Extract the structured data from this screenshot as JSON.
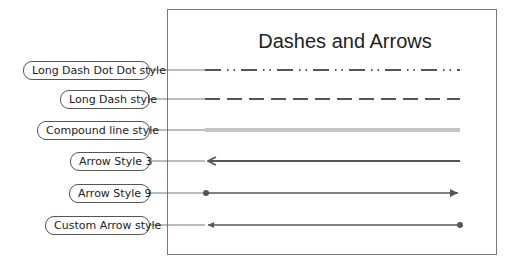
{
  "diagram": {
    "title": "Dashes and Arrows",
    "colors": {
      "line": "#555555",
      "frame": "#7a7a7a",
      "compound": "#8a8a8a",
      "label_border": "#555555"
    },
    "rows": [
      {
        "label": "Long Dash Dot Dot style",
        "style": "long-dash-dot-dot",
        "y": 70
      },
      {
        "label": "Long Dash style",
        "style": "long-dash",
        "y": 99
      },
      {
        "label": "Compound line style",
        "style": "compound",
        "y": 130
      },
      {
        "label": "Arrow Style 3",
        "style": "arrow-start-open",
        "y": 161
      },
      {
        "label": "Arrow Style 9",
        "style": "dot-start-arrow-end",
        "y": 193
      },
      {
        "label": "Custom Arrow style",
        "style": "arrow-start-dot-end",
        "y": 225
      }
    ]
  }
}
